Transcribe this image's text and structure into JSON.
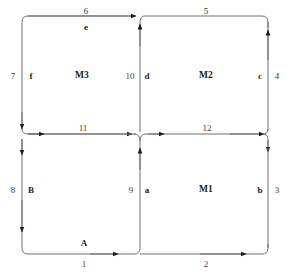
{
  "diagram": {
    "type": "block-flow-diagram",
    "background_color": "#ffffff",
    "line_color": "#6e6e6e",
    "text_color": "#1c1c1c",
    "regions": [
      {
        "id": "M1",
        "label": "M1",
        "position": "bottom-right"
      },
      {
        "id": "M2",
        "label": "M2",
        "position": "top-right"
      },
      {
        "id": "M3",
        "label": "M3",
        "position": "top-left"
      }
    ],
    "edge_numbers": {
      "bottom_left": "1",
      "bottom_right": "2",
      "right_lower": "3",
      "right_upper": "4",
      "top_right": "5",
      "top_left": "6",
      "left_upper": "7",
      "left_lower": "8",
      "center_lower": "9",
      "center_upper": "10",
      "middle_left": "11",
      "middle_right": "12"
    },
    "edge_letters": {
      "bottom_left": "A",
      "left_lower": "B",
      "center_lower": "a",
      "right_lower": "b",
      "right_upper": "c",
      "center_upper": "d",
      "top_left": "e",
      "left_upper": "f"
    }
  }
}
